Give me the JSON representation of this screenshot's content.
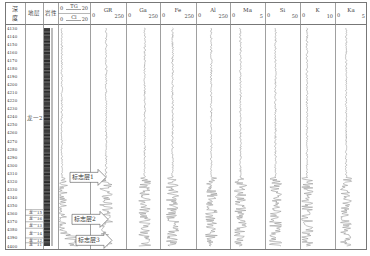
{
  "chart_data": {
    "type": "well-log",
    "title": "",
    "depth_axis": {
      "label": "深度",
      "unit": "m",
      "range": [
        4130,
        4400
      ],
      "ticks": [
        4130,
        4140,
        4150,
        4160,
        4170,
        4180,
        4190,
        4200,
        4210,
        4220,
        4230,
        4240,
        4250,
        4260,
        4270,
        4280,
        4290,
        4300,
        4310,
        4320,
        4330,
        4340,
        4350,
        4360,
        4370,
        4380,
        4390,
        4400
      ]
    },
    "columns": [
      {
        "key": "depth",
        "header": "深度"
      },
      {
        "key": "strata",
        "header": "地层"
      },
      {
        "key": "lithology",
        "header": "岩性"
      },
      {
        "key": "tg_cl",
        "header_top": "TG",
        "header_bottom": "Cl",
        "min_top": 0,
        "max_top": 20,
        "min_bottom": 0,
        "max_bottom": 20
      },
      {
        "key": "GR",
        "header": "GR",
        "min": 0,
        "max": 250
      },
      {
        "key": "Ga",
        "header": "Ga",
        "min": 0,
        "max": 250
      },
      {
        "key": "Fe",
        "header": "Fe",
        "min": 0,
        "max": 250
      },
      {
        "key": "Al",
        "header": "Al",
        "min": 0,
        "max": 250
      },
      {
        "key": "Ma",
        "header": "Ma",
        "min": 0,
        "max": 5
      },
      {
        "key": "Si",
        "header": "Si",
        "min": 0,
        "max": 50
      },
      {
        "key": "K",
        "header": "K",
        "min": 0,
        "max": 10
      },
      {
        "key": "Ka",
        "header": "Ka",
        "min": 0,
        "max": 5
      }
    ],
    "strata": [
      {
        "name": "龙一2",
        "top": 4130,
        "bottom": 4355
      },
      {
        "name": "龙一15",
        "top": 4355,
        "bottom": 4362
      },
      {
        "name": "龙一16",
        "top": 4362,
        "bottom": 4370
      },
      {
        "name": "龙一13",
        "top": 4370,
        "bottom": 4378
      },
      {
        "name": "龙一14",
        "top": 4378,
        "bottom": 4390
      },
      {
        "name": "龙一12",
        "top": 4390,
        "bottom": 4396
      },
      {
        "name": "龙一11",
        "top": 4396,
        "bottom": 4400
      }
    ],
    "markers": [
      {
        "label": "标志层1",
        "depth": 4315
      },
      {
        "label": "标志层2",
        "depth": 4367
      },
      {
        "label": "标志层3",
        "depth": 4393
      }
    ],
    "grid": false,
    "legend": "none"
  }
}
